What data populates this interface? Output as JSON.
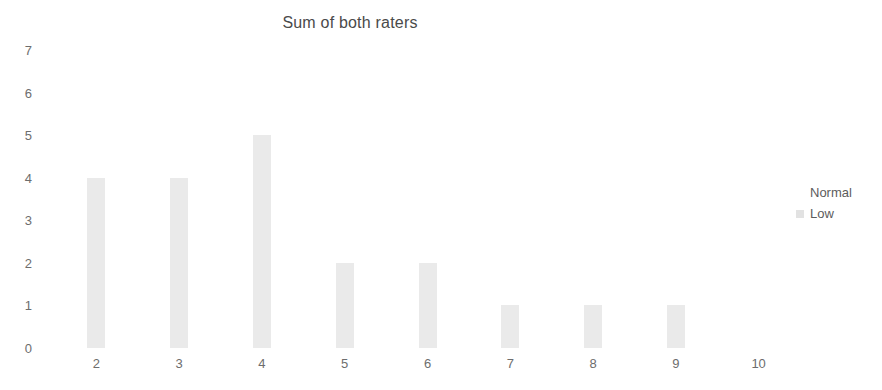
{
  "chart_data": {
    "type": "bar",
    "title": "Sum of both raters",
    "xlabel": "",
    "ylabel": "",
    "categories": [
      "2",
      "3",
      "4",
      "5",
      "6",
      "7",
      "8",
      "9",
      "10"
    ],
    "values": [
      4,
      4,
      5,
      2,
      2,
      1,
      1,
      1,
      0
    ],
    "series": [
      {
        "name": "Low",
        "values": [
          4,
          4,
          5,
          2,
          2,
          1,
          1,
          1,
          0
        ],
        "color": "#eaeaea"
      }
    ],
    "ylim": [
      0,
      7
    ],
    "y_ticks": [
      0,
      1,
      2,
      3,
      4,
      5,
      6,
      7
    ],
    "y_tick_labels": [
      "0",
      "1",
      "2",
      "3",
      "4",
      "5",
      "6",
      "7"
    ],
    "x_tick_labels": [
      "2",
      "3",
      "4",
      "5",
      "6",
      "7",
      "8",
      "9",
      "10"
    ],
    "grid": false,
    "legend_position": "right",
    "legend": [
      {
        "label": "Normal",
        "color": "#ffffff"
      },
      {
        "label": "Low",
        "color": "#e2e2e2"
      }
    ]
  },
  "colors": {
    "bar_fill": "#eaeaea",
    "title_text": "#4a4a4a",
    "tick_text": "#6d6d6d",
    "legend_text": "#5c5c5c",
    "background": "#ffffff"
  }
}
